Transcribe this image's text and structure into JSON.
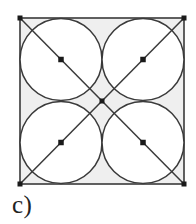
{
  "figure": {
    "caption": "c)",
    "colors": {
      "background": "#ffffff",
      "square_fill": "#efefef",
      "stroke": "#3a3a3a",
      "marker": "#1a1a1a",
      "caption": "#222222"
    },
    "square": {
      "x": 20,
      "y": 18,
      "width": 164,
      "height": 166,
      "stroke_width": 1.6,
      "label": "bounding-square"
    },
    "circles": [
      {
        "name": "circle-top-left",
        "cx": 61,
        "cy": 59.5,
        "r": 41
      },
      {
        "name": "circle-top-right",
        "cx": 143,
        "cy": 59.5,
        "r": 41
      },
      {
        "name": "circle-bottom-left",
        "cx": 61,
        "cy": 142.5,
        "r": 41
      },
      {
        "name": "circle-bottom-right",
        "cx": 143,
        "cy": 142.5,
        "r": 41
      }
    ],
    "diagonals": [
      {
        "name": "diagonal-tl-br",
        "x1": 20,
        "y1": 18,
        "x2": 184,
        "y2": 184
      },
      {
        "name": "diagonal-tr-bl",
        "x1": 184,
        "y1": 18,
        "x2": 20,
        "y2": 184
      }
    ],
    "markers": [
      {
        "name": "marker-corner-top-left",
        "cx": 20,
        "cy": 18,
        "size": 5
      },
      {
        "name": "marker-corner-top-right",
        "cx": 184,
        "cy": 18,
        "size": 5
      },
      {
        "name": "marker-corner-bottom-left",
        "cx": 20,
        "cy": 184,
        "size": 5
      },
      {
        "name": "marker-corner-bottom-right",
        "cx": 184,
        "cy": 184,
        "size": 5
      },
      {
        "name": "marker-center-top-left",
        "cx": 61,
        "cy": 59.5,
        "size": 5.5
      },
      {
        "name": "marker-center-top-right",
        "cx": 143,
        "cy": 59.5,
        "size": 5.5
      },
      {
        "name": "marker-center-bottom-left",
        "cx": 61,
        "cy": 142.5,
        "size": 5.5
      },
      {
        "name": "marker-center-bottom-right",
        "cx": 143,
        "cy": 142.5,
        "size": 5.5
      },
      {
        "name": "marker-square-center",
        "cx": 102,
        "cy": 101,
        "size": 5
      }
    ]
  }
}
